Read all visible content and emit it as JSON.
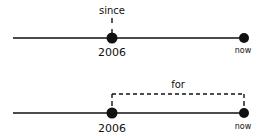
{
  "diagram": {
    "top_timeline": {
      "annotation": "since",
      "start_label": "2006",
      "end_label": "now"
    },
    "bottom_timeline": {
      "annotation": "for",
      "start_label": "2006",
      "end_label": "now"
    },
    "colors": {
      "ink": "#111111",
      "background": "#ffffff"
    }
  }
}
